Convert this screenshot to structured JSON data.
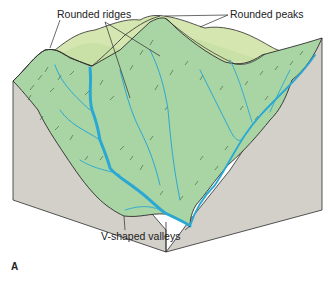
{
  "figure": {
    "panel_label": "A",
    "labels": {
      "rounded_ridges": "Rounded ridges",
      "rounded_peaks": "Rounded peaks",
      "v_shaped_valleys": "V-shaped valleys"
    },
    "colors": {
      "background": "#ffffff",
      "block_side": "#d3d0ca",
      "terrain_front": "#a9d4a4",
      "terrain_back": "#c9e0a6",
      "terrain_far": "#d6e6b0",
      "stream": "#2aa8d4",
      "outline": "#2b2b2b"
    }
  }
}
